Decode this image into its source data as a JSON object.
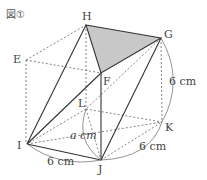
{
  "figure_label": "図①",
  "vertices": {
    "H": "H",
    "G": "G",
    "E": "E",
    "F": "F",
    "L": "L",
    "K": "K",
    "I": "I",
    "J": "J"
  },
  "measurements": {
    "gk": "6 cm",
    "jk": "6 cm",
    "ij": "6 cm",
    "lj": "a cm"
  },
  "colors": {
    "shaded_triangle": "#c8c8c8",
    "line": "#333333"
  }
}
